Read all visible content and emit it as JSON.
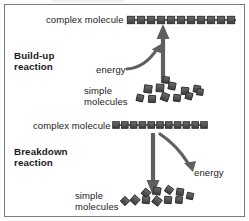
{
  "figure": {
    "title_hidden": "",
    "background_color": "#ffffff",
    "border_color": "#7b7b7b",
    "molecule_color": "#4a4a4a",
    "molecule_edge_color": "#2b2b2b",
    "arrow_color": "#5a5a5a",
    "text_color": "#1b1b1b"
  },
  "sections": {
    "buildup": {
      "name_line1": "Build-up",
      "name_line2": "reaction",
      "complex_label": "complex molecule",
      "energy_label": "energy",
      "simple_label_line1": "simple",
      "simple_label_line2": "molecules",
      "arrow_direction": "up",
      "energy_arrow_direction": "into-reaction"
    },
    "breakdown": {
      "name_line1": "Breakdown",
      "name_line2": "reaction",
      "complex_label": "complex molecule",
      "energy_label": "energy",
      "simple_label_line1": "simple",
      "simple_label_line2": "molecules",
      "arrow_direction": "down",
      "energy_arrow_direction": "out-of-reaction"
    }
  },
  "chart_data": {
    "type": "diagram",
    "chain_top_units": 11,
    "chain_bottom_units": 11,
    "simple_molecules_top_count": 12,
    "simple_molecules_bottom_count": 11,
    "annotations": [
      "complex molecule",
      "Build-up reaction",
      "energy",
      "simple molecules",
      "complex molecule",
      "Breakdown reaction",
      "energy",
      "simple molecules"
    ]
  }
}
